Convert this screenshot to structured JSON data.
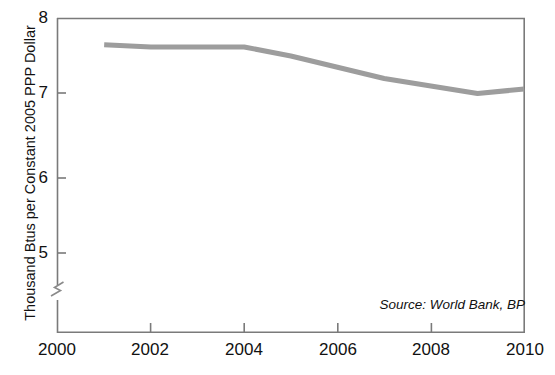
{
  "chart_data": {
    "type": "line",
    "title": "",
    "xlabel": "",
    "ylabel": "Thousand Btus per Constant 2005 PPP Dollar",
    "xlim": [
      2000,
      2010
    ],
    "ylim": [
      4.6,
      8
    ],
    "y_axis_break": true,
    "y_axis_break_below": 5,
    "grid": false,
    "legend": false,
    "x_ticks": [
      "2000",
      "2002",
      "2004",
      "2006",
      "2008",
      "2010"
    ],
    "x_tick_values": [
      2000,
      2002,
      2004,
      2006,
      2008,
      2010
    ],
    "y_ticks": [
      "5",
      "6",
      "7",
      "8"
    ],
    "y_tick_values": [
      5,
      6,
      7,
      8
    ],
    "line_color": "#9d9d9d",
    "axis_color": "#6e6e6e",
    "series": [
      {
        "name": "Energy intensity",
        "color": "#9d9d9d",
        "x": [
          2001,
          2002,
          2003,
          2004,
          2005,
          2006,
          2007,
          2008,
          2009,
          2010
        ],
        "values": [
          7.65,
          7.62,
          7.62,
          7.62,
          7.5,
          7.35,
          7.2,
          7.1,
          7.0,
          7.06
        ]
      }
    ],
    "annotations": [
      {
        "name": "source",
        "text": "Source: World Bank, BP"
      }
    ]
  },
  "labels": {
    "y_axis_title": "Thousand Btus per Constant 2005 PPP Dollar",
    "source_note": "Source: World Bank, BP",
    "title": ""
  }
}
